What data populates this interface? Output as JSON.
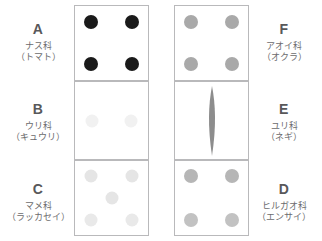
{
  "figure": {
    "type": "specimen-grid",
    "columns": 2,
    "rows": 3,
    "background_color": "#ffffff",
    "cell_border_color": "#b9b9bb"
  },
  "left_column": [
    {
      "letter": "A",
      "family": "ナス科",
      "example": "（トマト）",
      "pattern": "four-corner-dots",
      "dot_color": "#1a1a1a",
      "dot_count": 4
    },
    {
      "letter": "B",
      "family": "ウリ科",
      "example": "（キュウリ）",
      "pattern": "two-side-dots",
      "dot_color": "#f0f0f0",
      "dot_count": 2
    },
    {
      "letter": "C",
      "family": "マメ科",
      "example": "（ラッカセイ）",
      "pattern": "five-quincunx-dots",
      "dot_color": "#e4e4e4",
      "dot_count": 5
    }
  ],
  "right_column": [
    {
      "letter": "F",
      "family": "アオイ科",
      "example": "（オクラ）",
      "pattern": "four-corner-dots",
      "dot_color": "#a8a8a8",
      "dot_count": 4
    },
    {
      "letter": "E",
      "family": "ユリ科",
      "example": "（ネギ）",
      "pattern": "vertical-blade",
      "dot_color": "#8c8c8c",
      "dot_count": 0
    },
    {
      "letter": "D",
      "family": "ヒルガオ科",
      "example": "（エンサイ）",
      "pattern": "four-corner-dots",
      "dot_color": "#bdbdbd",
      "dot_count": 4
    }
  ]
}
